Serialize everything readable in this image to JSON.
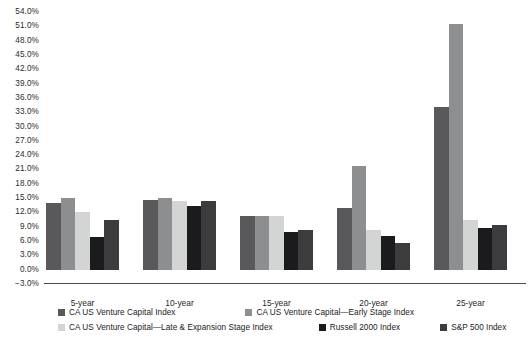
{
  "chart_data": {
    "type": "bar",
    "title": "",
    "subtitle": "",
    "xlabel": "",
    "ylabel": "",
    "categories": [
      "5-year",
      "10-year",
      "15-year",
      "20-year",
      "25-year"
    ],
    "series": [
      {
        "name": "CA US Venture Capital Index",
        "color": "#59595b",
        "values": [
          14.0,
          14.7,
          11.2,
          13.0,
          34.0
        ]
      },
      {
        "name": "CA US Venture Capital—Early Stage Index",
        "color": "#8d8e90",
        "values": [
          15.1,
          15.1,
          11.2,
          21.8,
          51.5
        ]
      },
      {
        "name": "CA US Venture Capital—Late & Expansion Stage Index",
        "color": "#d3d4d4",
        "values": [
          12.1,
          14.5,
          11.2,
          8.4,
          10.5
        ]
      },
      {
        "name": "Russell 2000 Index",
        "color": "#1b1b1d",
        "values": [
          6.8,
          13.4,
          7.8,
          7.0,
          8.8
        ]
      },
      {
        "name": "S&P 500 Index",
        "color": "#3c3c3e",
        "values": [
          10.4,
          14.5,
          8.4,
          5.7,
          9.4
        ]
      }
    ],
    "y_ticks": [
      "54.0%",
      "51.0%",
      "48.0%",
      "45.0%",
      "42.0%",
      "39.0%",
      "36.0%",
      "33.0%",
      "30.0%",
      "27.0%",
      "24.0%",
      "21.0%",
      "18.0%",
      "15.0%",
      "12.0%",
      "9.0%",
      "6.0%",
      "3.0%",
      "0.0%",
      "−3.0%"
    ],
    "ylim": [
      -3.0,
      54.0
    ],
    "y_tick_step": 3.0,
    "grid": false,
    "legend_position": "bottom",
    "axis_color": "#4a4a4a",
    "background": "#ffffff"
  },
  "legend": {
    "rows": [
      [
        {
          "label": "CA US Venture Capital Index",
          "color": "#59595b"
        },
        {
          "label": "CA US Venture Capital—Early Stage Index",
          "color": "#8d8e90"
        }
      ],
      [
        {
          "label": "CA US Venture Capital—Late & Expansion Stage Index",
          "color": "#d3d4d4"
        },
        {
          "label": "Russell 2000 Index",
          "color": "#1b1b1d"
        },
        {
          "label": "S&P 500 Index",
          "color": "#3c3c3e"
        }
      ]
    ]
  }
}
